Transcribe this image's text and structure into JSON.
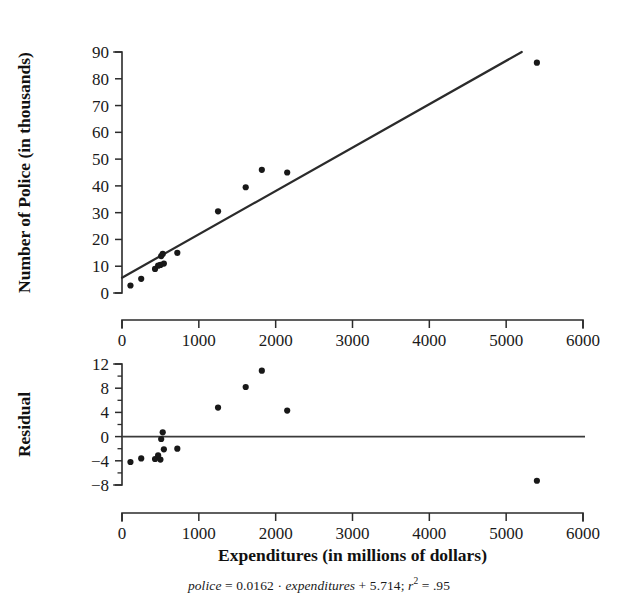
{
  "figure": {
    "x_axis_title": "Expenditures (in millions of dollars)",
    "caption": {
      "response_var": "police",
      "eq_mid": " = 0.0162 · ",
      "predictor_var": "expenditures",
      "eq_tail": " + 5.714; ",
      "r_symbol": "r",
      "r_exponent": "2",
      "r_value": " = .95"
    }
  },
  "scatter": {
    "y_axis_title": "Number of Police (in thousands)",
    "x_ticklabels": [
      "0",
      "1000",
      "2000",
      "3000",
      "4000",
      "5000",
      "6000"
    ],
    "y_ticklabels": [
      "0",
      "10",
      "20",
      "30",
      "40",
      "50",
      "60",
      "70",
      "80",
      "90"
    ]
  },
  "residual": {
    "y_axis_title": "Residual",
    "x_ticklabels": [
      "0",
      "1000",
      "2000",
      "3000",
      "4000",
      "5000",
      "6000"
    ],
    "y_ticklabels": [
      "12",
      "8",
      "4",
      "0",
      "−4",
      "−8"
    ]
  },
  "chart_data": [
    {
      "type": "scatter",
      "title": "",
      "xlabel": "Expenditures (in millions of dollars)",
      "ylabel": "Number of Police (in thousands)",
      "xlim": [
        0,
        6000
      ],
      "ylim": [
        0,
        90
      ],
      "xticks": [
        0,
        1000,
        2000,
        3000,
        4000,
        5000,
        6000
      ],
      "yticks": [
        0,
        10,
        20,
        30,
        40,
        50,
        60,
        70,
        80,
        90
      ],
      "grid": false,
      "legend": "none",
      "x": [
        110,
        250,
        430,
        470,
        500,
        510,
        530,
        545,
        720,
        1250,
        1610,
        1820,
        2150,
        5400
      ],
      "y": [
        2.8,
        5.3,
        9.0,
        10.2,
        10.5,
        13.8,
        14.6,
        11.0,
        15.0,
        30.5,
        39.5,
        46.0,
        45.0,
        86.0
      ],
      "fit_line": {
        "type": "line",
        "slope": 0.0162,
        "intercept": 5.714,
        "r_squared": 0.95,
        "x_start": 0,
        "x_end": 5400,
        "y_start": 5.714,
        "y_end": 93.2
      }
    },
    {
      "type": "scatter",
      "title": "",
      "xlabel": "Expenditures (in millions of dollars)",
      "ylabel": "Residual",
      "xlim": [
        0,
        6000
      ],
      "ylim": [
        -8,
        12
      ],
      "xticks": [
        0,
        1000,
        2000,
        3000,
        4000,
        5000,
        6000
      ],
      "yticks": [
        -8,
        -4,
        0,
        4,
        8,
        12
      ],
      "grid": false,
      "legend": "none",
      "reference_line_y": 0,
      "x": [
        110,
        250,
        430,
        470,
        500,
        510,
        530,
        545,
        720,
        1250,
        1610,
        1820,
        2150,
        5400
      ],
      "y": [
        -4.2,
        -3.6,
        -3.7,
        -3.1,
        -3.8,
        -0.4,
        0.7,
        -2.1,
        -2.0,
        4.8,
        8.2,
        10.9,
        4.3,
        -7.3
      ]
    }
  ]
}
